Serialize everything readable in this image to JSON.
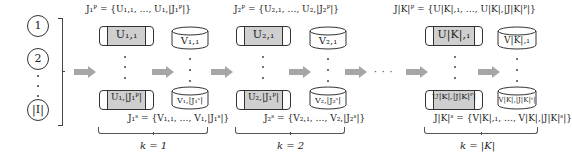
{
  "items": {
    "circles": [
      "1",
      "2",
      "|I|"
    ]
  },
  "groups": [
    {
      "k_label": "k = 1",
      "primary_set": "J₁ᴾ = {U₁,₁, …, U₁,|J₁ᴾ|}",
      "secondary_set": "J₁ˢ = {V₁,₁, …, V₁,|J₁ˢ|}",
      "u_top": "U₁,₁",
      "u_bottom": "U₁,|J₁ᴾ|",
      "v_top": "V₁,₁",
      "v_bottom": "V₁,|J₁ˢ|"
    },
    {
      "k_label": "k = 2",
      "primary_set": "J₂ᴾ = {U₂,₁, …, U₂,|J₂ᴾ|}",
      "secondary_set": "J₂ˢ = {V₂,₁, …, V₂,|J₂ˢ|}",
      "u_top": "U₂,₁",
      "u_bottom": "U₂,|J₁ᴾ|",
      "v_top": "V₂,₁",
      "v_bottom": "V₂,|J₂ˢ|"
    },
    {
      "k_label": "k = |K|",
      "primary_set": "J|K|ᴾ = {U|K|,₁, …, U|K|,|J|K|ᴾ|}",
      "secondary_set": "J|K|ˢ = {V|K|,₁, …, V|K|,|J|K|ˢ|}",
      "u_top": "U|K|,₁",
      "u_bottom": "U|K|,|J|K|ᴾ|",
      "v_top": "V|K|,₁",
      "v_bottom": "V|K|,|J|K|ˢ|"
    }
  ],
  "ellipsis": "· · ·",
  "colors": {
    "arrow": "#a6a6a6",
    "u_fill": "#cfcfcf",
    "stroke": "#333333"
  }
}
